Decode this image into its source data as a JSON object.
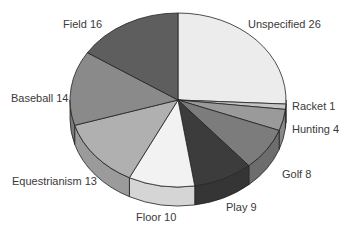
{
  "chart_data": {
    "type": "pie",
    "style": "3d",
    "title": "",
    "categories": [
      "Unspecified",
      "Racket",
      "Hunting",
      "Golf",
      "Play",
      "Floor",
      "Equestrianism",
      "Baseball",
      "Field"
    ],
    "values": [
      26,
      1,
      4,
      8,
      9,
      10,
      13,
      14,
      16
    ],
    "labels": [
      "Unspecified 26",
      "Racket 1",
      "Hunting 4",
      "Golf 8",
      "Play 9",
      "Floor 10",
      "Equestrianism 13",
      "Baseball 14",
      "Field 16"
    ],
    "colors": [
      "#ececec",
      "#c4c4c4",
      "#9a9a9a",
      "#7c7c7c",
      "#3c3c3c",
      "#f2f2f2",
      "#b0b0b0",
      "#8a8a8a",
      "#5e5e5e"
    ],
    "start_angle": "12 o'clock",
    "direction": "clockwise",
    "legend": "none (direct labels)"
  },
  "label_positions": [
    {
      "x": 248,
      "y": 28
    },
    {
      "x": 292,
      "y": 110
    },
    {
      "x": 292,
      "y": 133
    },
    {
      "x": 282,
      "y": 178
    },
    {
      "x": 226,
      "y": 211
    },
    {
      "x": 136,
      "y": 221
    },
    {
      "x": 12,
      "y": 185
    },
    {
      "x": 11,
      "y": 102
    },
    {
      "x": 63,
      "y": 28
    }
  ]
}
